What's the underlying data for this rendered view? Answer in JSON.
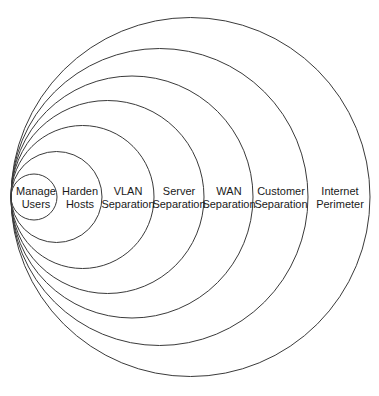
{
  "diagram": {
    "type": "concentric-tangent-circles",
    "title": "",
    "background_color": "#ffffff",
    "stroke_color": "#3a3a3a",
    "text_color": "#1a1a1a",
    "tangent_point": {
      "x": 11,
      "y": 197
    },
    "rings": [
      {
        "id": "manage-users",
        "index": 1,
        "label_lines": [
          "Manage",
          "Users"
        ],
        "label_text": "Manage Users",
        "center_x": 34,
        "center_y": 197,
        "radius": 23,
        "right_edge_x": 57,
        "label_x": 36,
        "label_y": 197
      },
      {
        "id": "harden-hosts",
        "index": 2,
        "label_lines": [
          "Harden",
          "Hosts"
        ],
        "label_text": "Harden Hosts",
        "center_x": 56.5,
        "center_y": 197,
        "radius": 45.5,
        "right_edge_x": 102,
        "label_x": 80,
        "label_y": 197
      },
      {
        "id": "vlan-separation",
        "index": 3,
        "label_lines": [
          "VLAN",
          "Separation"
        ],
        "label_text": "VLAN Separation",
        "center_x": 82.5,
        "center_y": 197,
        "radius": 71.5,
        "right_edge_x": 154,
        "label_x": 128,
        "label_y": 197
      },
      {
        "id": "server-separation",
        "index": 4,
        "label_lines": [
          "Server",
          "Separation"
        ],
        "label_text": "Server Separation",
        "center_x": 107.5,
        "center_y": 197,
        "radius": 96.5,
        "right_edge_x": 204,
        "label_x": 179,
        "label_y": 197
      },
      {
        "id": "wan-separation",
        "index": 5,
        "label_lines": [
          "WAN",
          "Separation"
        ],
        "label_text": "WAN Separation",
        "center_x": 132,
        "center_y": 197,
        "radius": 121,
        "right_edge_x": 253,
        "label_x": 229,
        "label_y": 197
      },
      {
        "id": "customer-separation",
        "index": 6,
        "label_lines": [
          "Customer",
          "Separation"
        ],
        "label_text": "Customer Separation",
        "center_x": 159.5,
        "center_y": 197,
        "radius": 148.5,
        "right_edge_x": 308,
        "label_x": 281,
        "label_y": 197
      },
      {
        "id": "internet-perimeter",
        "index": 7,
        "label_lines": [
          "Internet",
          "Perimeter"
        ],
        "label_text": "Internet Perimeter",
        "center_x": 190.5,
        "center_y": 197,
        "radius": 179.5,
        "right_edge_x": 370,
        "label_x": 340,
        "label_y": 197
      }
    ]
  }
}
